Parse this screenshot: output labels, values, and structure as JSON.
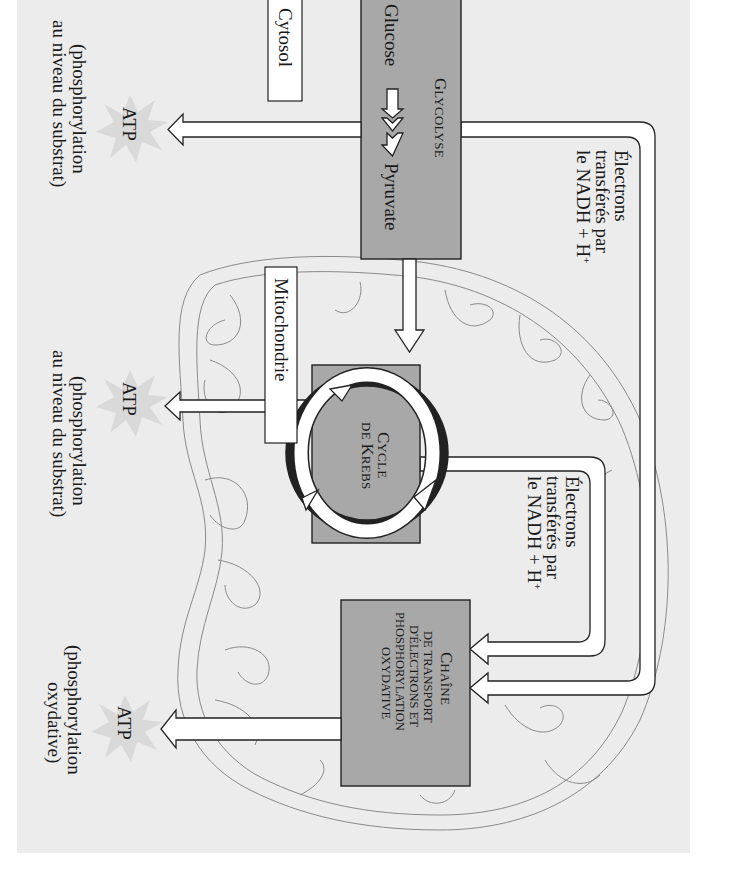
{
  "figure": {
    "orientation": "rotated-90-clockwise",
    "colors": {
      "panel": "#ececec",
      "process_box": "#a8a8a8",
      "label_box": "#ffffff",
      "arrow": "#ffffff",
      "mitochondrion_outline": "#8a8a8a",
      "atp_burst": "#d9d9d9"
    },
    "compartments": {
      "cytosol": "Cytosol",
      "mitochondrie": "Mitochondrie"
    },
    "glycolyse": {
      "title_cap": "G",
      "title_rest": "LYCOLYSE",
      "input": "Glucose",
      "output": "Pyruvate"
    },
    "krebs": {
      "line1_cap": "C",
      "line1_rest": "YCLE",
      "line2_prefix": "DE ",
      "line2_cap": "K",
      "line2_rest": "REBS"
    },
    "chaine": {
      "line1_cap": "C",
      "line1_rest": "HAÎNE",
      "line2": "DE TRANSPORT",
      "line3": "D'ÉLECTRONS ET",
      "line4": "PHOSPHORYLATION",
      "line5": "OXYDATIVE"
    },
    "electron_labels": [
      {
        "line1": "Électrons",
        "line2": "transférés par",
        "line3_main": "le NADH + H",
        "line3_sup": "+"
      },
      {
        "line1": "Électrons",
        "line2": "transférés par",
        "line3_main": "le NADH + H",
        "line3_sup": "+"
      }
    ],
    "atp_outputs": [
      {
        "label": "ATP",
        "note_line1": "(phosphorylation",
        "note_line2": "au niveau du substrat)"
      },
      {
        "label": "ATP",
        "note_line1": "(phosphorylation",
        "note_line2": "au niveau du substrat)"
      },
      {
        "label": "ATP",
        "note_line1": "(phosphorylation",
        "note_line2": "oxydative)"
      }
    ]
  }
}
